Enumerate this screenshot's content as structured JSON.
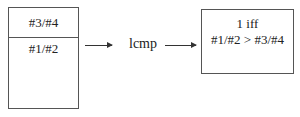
{
  "stack": {
    "top_cell": "#3/#4",
    "bottom_cell": "#1/#2"
  },
  "instruction": {
    "label": "lcmp"
  },
  "result": {
    "line1": "1 iff",
    "line2": "#1/#2 > #3/#4"
  },
  "arrows": [
    {
      "from": "stack",
      "to": "instruction"
    },
    {
      "from": "instruction",
      "to": "result"
    }
  ]
}
